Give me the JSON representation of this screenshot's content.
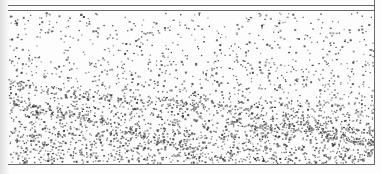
{
  "image": {
    "description": "Scanned stipple illustration: rectangular frame with double top rule, filled with dots increasing in density toward the bottom, with faint diagonal wave bands",
    "width": 381,
    "height": 174,
    "background": "#fdfdfd",
    "ink_color": "#555555",
    "frame": {
      "top_rule_1_y": 5,
      "top_rule_2_y": 10,
      "right_border_x": 374,
      "bottom_border_y": 164,
      "left_x": 8,
      "line_color": "#6a6a6a"
    },
    "stipple": {
      "seed": 1337,
      "regions": [
        {
          "y0": 12,
          "y1": 60,
          "count": 380
        },
        {
          "y0": 60,
          "y1": 100,
          "count": 520
        },
        {
          "y0": 100,
          "y1": 130,
          "count": 760
        },
        {
          "y0": 130,
          "y1": 163,
          "count": 1100
        }
      ],
      "bands": [
        {
          "x0": 8,
          "y0": 82,
          "x1": 374,
          "y1": 130,
          "count": 220
        },
        {
          "x0": 8,
          "y0": 98,
          "x1": 200,
          "y1": 150,
          "count": 180
        },
        {
          "x0": 230,
          "y0": 120,
          "x1": 374,
          "y1": 140,
          "count": 160
        }
      ]
    }
  }
}
